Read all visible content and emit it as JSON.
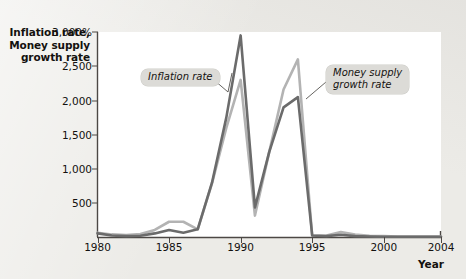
{
  "figure": {
    "y_axis_title": "Inflation rate,\nMoney supply\ngrowth rate",
    "x_axis_title": "Year"
  },
  "annotations": {
    "inflation_label": "Inflation rate",
    "money_label": "Money supply\ngrowth rate"
  },
  "colors": {
    "inflation_line": "#6b6b6b",
    "money_line": "#b3b3b3",
    "axis": "#4c4845",
    "plot_background": "#ffffff",
    "page_background": "#ecebe7",
    "callout_background": "#dcdbd7",
    "text": "#13110f"
  },
  "chart_data": {
    "type": "line",
    "title": "",
    "xlabel": "Year",
    "ylabel": "Inflation rate, Money supply growth rate",
    "xlim": [
      1980,
      2004
    ],
    "ylim": [
      0,
      3000
    ],
    "grid": false,
    "legend_position": "inline-annotations",
    "x_ticks": [
      1980,
      1985,
      1990,
      1995,
      2000,
      2004
    ],
    "x_tick_labels": [
      "1980",
      "1985",
      "1990",
      "1995",
      "2000",
      "2004"
    ],
    "y_ticks": [
      500,
      1000,
      1500,
      2000,
      2500,
      3000
    ],
    "y_tick_labels": [
      "500",
      "1,000",
      "1,500",
      "2,000",
      "2,500",
      "3,000%"
    ],
    "x": [
      1980,
      1981,
      1982,
      1983,
      1984,
      1985,
      1986,
      1987,
      1988,
      1989,
      1990,
      1991,
      1992,
      1993,
      1994,
      1995,
      1996,
      1997,
      1998,
      1999,
      2000,
      2001,
      2002,
      2003,
      2004
    ],
    "series": [
      {
        "name": "Inflation rate",
        "color": "#6b6b6b",
        "values": [
          60,
          30,
          20,
          25,
          60,
          110,
          70,
          120,
          800,
          1750,
          2950,
          440,
          1250,
          1900,
          2050,
          30,
          20,
          40,
          20,
          15,
          10,
          10,
          10,
          10,
          10
        ]
      },
      {
        "name": "Money supply growth rate",
        "color": "#b3b3b3",
        "values": [
          70,
          45,
          35,
          50,
          110,
          230,
          230,
          120,
          790,
          1600,
          2300,
          320,
          1250,
          2160,
          2600,
          25,
          30,
          80,
          45,
          25,
          20,
          15,
          15,
          15,
          15
        ]
      }
    ]
  }
}
